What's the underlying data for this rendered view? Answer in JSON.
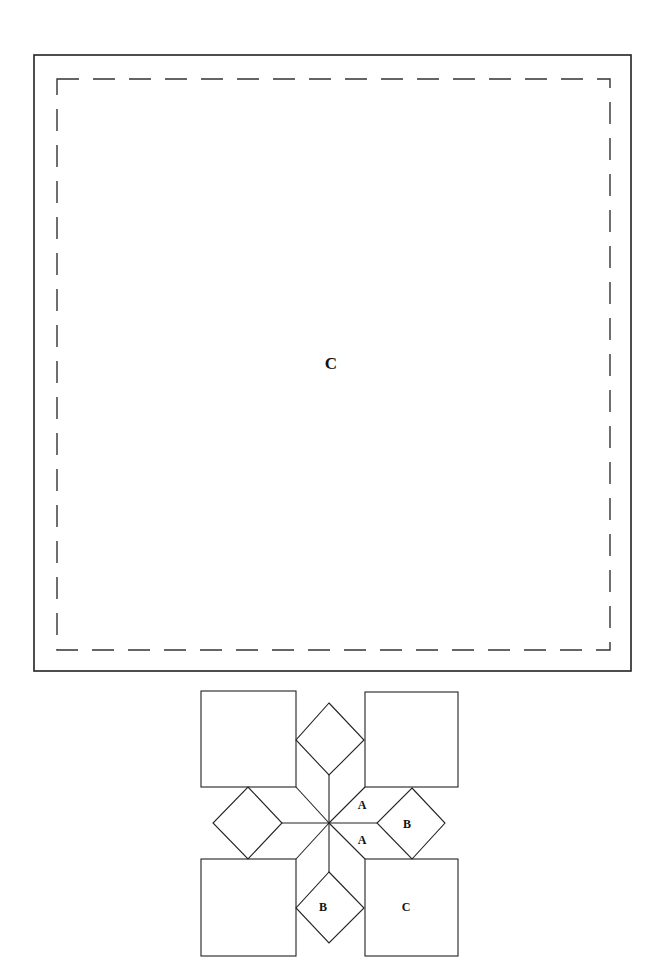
{
  "template": {
    "outer_frame": {
      "x": 34,
      "y": 55,
      "w": 597,
      "h": 616
    },
    "seam_line": {
      "x": 57,
      "y": 79,
      "w": 553,
      "h": 571,
      "dash": "22 14"
    },
    "piece_label": "C",
    "label_pos": {
      "x": 331,
      "y": 369
    }
  },
  "block_diagram": {
    "center": {
      "x": 329,
      "y": 823
    },
    "squares": [
      {
        "name": "top-left",
        "x": 201,
        "y": 691,
        "w": 95,
        "h": 96,
        "label": ""
      },
      {
        "name": "top-right",
        "x": 365,
        "y": 692,
        "w": 93,
        "h": 95,
        "label": ""
      },
      {
        "name": "bottom-left",
        "x": 201,
        "y": 859,
        "w": 95,
        "h": 97,
        "label": ""
      },
      {
        "name": "bottom-right",
        "x": 365,
        "y": 859,
        "w": 93,
        "h": 97,
        "label": "C"
      }
    ],
    "diamonds": [
      {
        "name": "top",
        "points": "329,703 364,740 329,775 296,740",
        "label": ""
      },
      {
        "name": "left",
        "points": "248,787 282,823 248,859 213,823",
        "label": ""
      },
      {
        "name": "right",
        "points": "412,788 445,823 412,859 377,823",
        "label": "B"
      },
      {
        "name": "bottom",
        "points": "329,872 364,908 329,943 296,908",
        "label": "B"
      }
    ],
    "labels": [
      {
        "text": "A",
        "x": 362,
        "y": 809
      },
      {
        "text": "A",
        "x": 362,
        "y": 844
      },
      {
        "text": "B",
        "x": 407,
        "y": 828
      },
      {
        "text": "B",
        "x": 323,
        "y": 911
      },
      {
        "text": "C",
        "x": 406,
        "y": 911
      }
    ]
  }
}
